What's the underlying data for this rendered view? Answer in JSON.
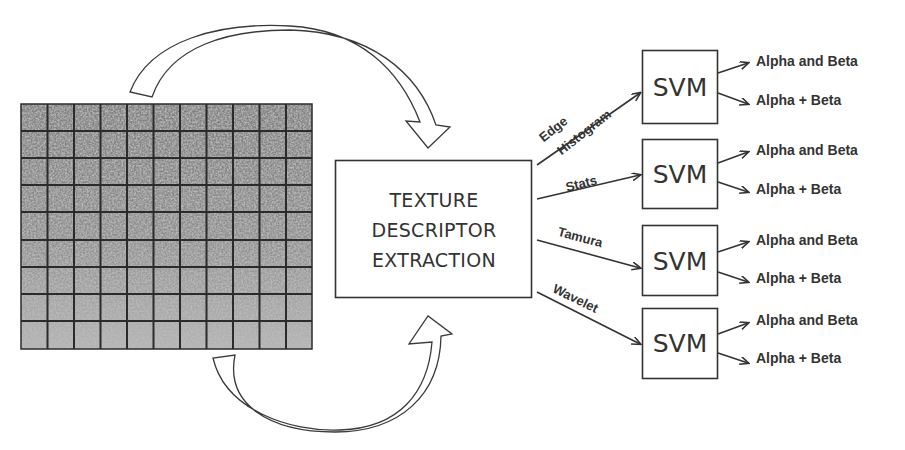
{
  "diagram": {
    "input": {
      "name": "texture-image-grid",
      "columns": 11,
      "rows": 9
    },
    "process_box": {
      "lines": [
        "TEXTURE",
        "DESCRIPTOR",
        "EXTRACTION"
      ]
    },
    "branches": [
      {
        "feature_lines": [
          "Edge",
          "Histogram"
        ],
        "classifier": "SVM",
        "outputs": [
          "Alpha and Beta",
          "Alpha + Beta"
        ]
      },
      {
        "feature_lines": [
          "Stats"
        ],
        "classifier": "SVM",
        "outputs": [
          "Alpha and Beta",
          "Alpha + Beta"
        ]
      },
      {
        "feature_lines": [
          "Tamura"
        ],
        "classifier": "SVM",
        "outputs": [
          "Alpha and Beta",
          "Alpha + Beta"
        ]
      },
      {
        "feature_lines": [
          "Wavelet"
        ],
        "classifier": "SVM",
        "outputs": [
          "Alpha and Beta",
          "Alpha + Beta"
        ]
      }
    ],
    "colors": {
      "stroke": "#333333",
      "text": "#333333",
      "grid_line": "#2b2b2b",
      "texture_base": "#8c8c8c",
      "background": "#ffffff"
    }
  }
}
